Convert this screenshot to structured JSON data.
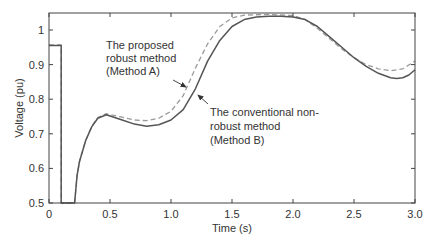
{
  "chart_data": {
    "type": "line",
    "title": "",
    "xlabel": "Time (s)",
    "ylabel": "Voltage (pu)",
    "xlim": [
      0,
      3.0
    ],
    "ylim": [
      0.5,
      1.05
    ],
    "grid": false,
    "legend": "none (inline annotations with arrows)",
    "x_ticks": [
      "0",
      "0.5",
      "1.0",
      "1.5",
      "2.0",
      "2.5",
      "3.0"
    ],
    "x_tick_values": [
      0,
      0.5,
      1.0,
      1.5,
      2.0,
      2.5,
      3.0
    ],
    "y_ticks": [
      "0.5",
      "0.6",
      "0.7",
      "0.8",
      "0.9",
      "1"
    ],
    "y_tick_values": [
      0.5,
      0.6,
      0.7,
      0.8,
      0.9,
      1.0
    ],
    "series": [
      {
        "name": "The conventional non-robust method (Method B)",
        "style": "solid",
        "color": "#555555",
        "points": [
          [
            0,
            0.955
          ],
          [
            0.1,
            0.955
          ],
          [
            0.1,
            0.5
          ],
          [
            0.1,
            0.5
          ],
          [
            0.21,
            0.5
          ],
          [
            0.23,
            0.58
          ],
          [
            0.25,
            0.62
          ],
          [
            0.3,
            0.68
          ],
          [
            0.35,
            0.72
          ],
          [
            0.4,
            0.745
          ],
          [
            0.47,
            0.755
          ],
          [
            0.6,
            0.74
          ],
          [
            0.7,
            0.728
          ],
          [
            0.8,
            0.722
          ],
          [
            0.9,
            0.726
          ],
          [
            1.0,
            0.74
          ],
          [
            1.1,
            0.77
          ],
          [
            1.2,
            0.83
          ],
          [
            1.3,
            0.91
          ],
          [
            1.4,
            0.97
          ],
          [
            1.5,
            1.01
          ],
          [
            1.6,
            1.03
          ],
          [
            1.7,
            1.038
          ],
          [
            1.8,
            1.04
          ],
          [
            1.9,
            1.04
          ],
          [
            2.0,
            1.038
          ],
          [
            2.1,
            1.03
          ],
          [
            2.2,
            1.01
          ],
          [
            2.3,
            0.98
          ],
          [
            2.4,
            0.95
          ],
          [
            2.5,
            0.92
          ],
          [
            2.6,
            0.895
          ],
          [
            2.7,
            0.875
          ],
          [
            2.8,
            0.862
          ],
          [
            2.85,
            0.86
          ],
          [
            2.9,
            0.862
          ],
          [
            2.95,
            0.87
          ],
          [
            3.0,
            0.885
          ]
        ]
      },
      {
        "name": "The proposed robust method (Method A)",
        "style": "dashed",
        "color": "#9a9a9a",
        "points": [
          [
            0,
            0.957
          ],
          [
            0.1,
            0.957
          ],
          [
            0.1,
            0.5
          ],
          [
            0.21,
            0.5
          ],
          [
            0.23,
            0.58
          ],
          [
            0.25,
            0.62
          ],
          [
            0.3,
            0.68
          ],
          [
            0.35,
            0.722
          ],
          [
            0.4,
            0.747
          ],
          [
            0.47,
            0.758
          ],
          [
            0.6,
            0.748
          ],
          [
            0.7,
            0.74
          ],
          [
            0.8,
            0.738
          ],
          [
            0.9,
            0.745
          ],
          [
            1.0,
            0.765
          ],
          [
            1.1,
            0.81
          ],
          [
            1.2,
            0.89
          ],
          [
            1.3,
            0.96
          ],
          [
            1.4,
            1.01
          ],
          [
            1.5,
            1.035
          ],
          [
            1.6,
            1.043
          ],
          [
            1.8,
            1.045
          ],
          [
            2.0,
            1.042
          ],
          [
            2.1,
            1.03
          ],
          [
            2.2,
            1.005
          ],
          [
            2.3,
            0.975
          ],
          [
            2.4,
            0.945
          ],
          [
            2.5,
            0.92
          ],
          [
            2.6,
            0.9
          ],
          [
            2.7,
            0.888
          ],
          [
            2.8,
            0.882
          ],
          [
            2.9,
            0.888
          ],
          [
            3.0,
            0.91
          ]
        ]
      }
    ],
    "annotations": [
      {
        "lines": [
          "The proposed",
          "robust method",
          "(Method A)"
        ],
        "points_to": "dashed curve near t=1.15",
        "arrow": true
      },
      {
        "lines": [
          "The conventional non-",
          "robust method",
          "(Method B)"
        ],
        "points_to": "solid curve near t=1.22",
        "arrow": true
      }
    ]
  },
  "plot": {
    "axis_color": "#444444",
    "solid_color": "#555555",
    "dashed_color": "#9a9a9a"
  }
}
